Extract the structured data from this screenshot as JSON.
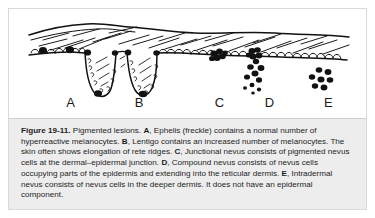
{
  "figure": {
    "number_label": "Figure 19-11.",
    "caption_segments": [
      {
        "text": "Figure 19-11.",
        "bold": true
      },
      {
        "text": " Pigmented lesions. ",
        "bold": false
      },
      {
        "text": "A",
        "bold": true
      },
      {
        "text": ", Ephelis (freckle) contains a normal number of hyperreactive melanocytes. ",
        "bold": false
      },
      {
        "text": "B",
        "bold": true
      },
      {
        "text": ", Lentigo contains an increased number of melanocytes. The skin often shows elongation of rete ridges. ",
        "bold": false
      },
      {
        "text": "C",
        "bold": true
      },
      {
        "text": ", Junctional nevus consists of pigmented nevus cells at the dermal–epidermal junction. ",
        "bold": false
      },
      {
        "text": "D",
        "bold": true
      },
      {
        "text": ", Compound nevus consists of nevus cells occupying parts of the epidermis and extending into the reticular dermis. ",
        "bold": false
      },
      {
        "text": "E",
        "bold": true
      },
      {
        "text": ", Intradermal nevus consists of nevus cells in the deeper dermis. It does not have an epidermal component.",
        "bold": false
      }
    ],
    "caption_plain": "Figure 19-11. Pigmented lesions. A, Ephelis (freckle) contains a normal number of hyperreactive melanocytes. B, Lentigo contains an increased number of melanocytes. The skin often shows elongation of rete ridges. C, Junctional nevus consists of pigmented nevus cells at the dermal–epidermal junction. D, Compound nevus consists of nevus cells occupying parts of the epidermis and extending into the reticular dermis. E, Intradermal nevus consists of nevus cells in the deeper dermis. It does not have an epidermal component."
  },
  "panels": [
    {
      "letter": "A",
      "x_percent": 17.3,
      "name": "ephelis-freckle"
    },
    {
      "letter": "B",
      "x_percent": 36.5,
      "name": "lentigo"
    },
    {
      "letter": "C",
      "x_percent": 59.0,
      "name": "junctional-nevus"
    },
    {
      "letter": "D",
      "x_percent": 73.0,
      "name": "compound-nevus"
    },
    {
      "letter": "E",
      "x_percent": 89.5,
      "name": "intradermal-nevus"
    }
  ],
  "colors": {
    "ink": "#111111",
    "page_background": "#ffffff",
    "caption_background": "#ededed",
    "frame_border": "#d9d9d9",
    "caption_border": "#cfcfcf",
    "label_text": "#1a1a1a",
    "caption_text": "#1d1d1d"
  }
}
